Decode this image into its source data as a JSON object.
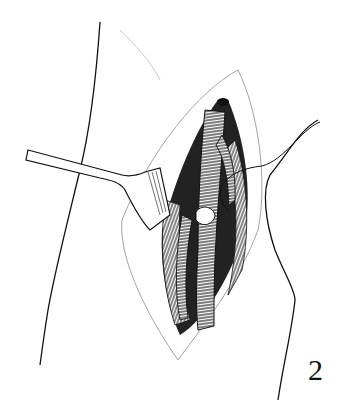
{
  "figure": {
    "label": "2",
    "colors": {
      "ink": "#111111",
      "background": "#ffffff",
      "skin_edge": "#999999"
    }
  }
}
